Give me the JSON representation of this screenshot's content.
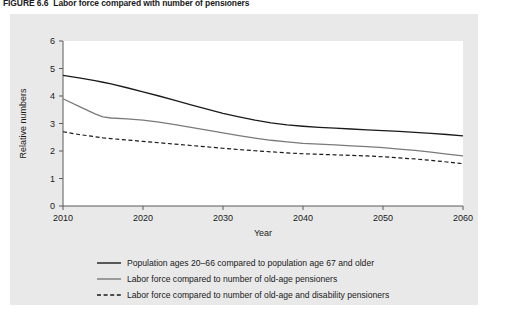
{
  "figure": {
    "number": "FIGURE 6.6",
    "caption": "Labor force compared with number of pensioners"
  },
  "panel": {
    "background_color": "#e9e9e9",
    "plot_background_color": "#ffffff"
  },
  "chart_data": {
    "type": "line",
    "title": "",
    "xlabel": "Year",
    "ylabel": "Relative numbers",
    "xlim": [
      2010,
      2060
    ],
    "ylim": [
      0,
      6
    ],
    "xticks": [
      2010,
      2020,
      2030,
      2040,
      2050,
      2060
    ],
    "xtick_labels": [
      "2010",
      "2020",
      "2030",
      "2040",
      "2050",
      "2060"
    ],
    "yticks": [
      0,
      1,
      2,
      3,
      4,
      5,
      6
    ],
    "ytick_labels": [
      "0",
      "1",
      "2",
      "3",
      "4",
      "5",
      "6"
    ],
    "grid": false,
    "legend_position": "below-left",
    "x": [
      2010,
      2012,
      2014,
      2015,
      2016,
      2018,
      2020,
      2022,
      2024,
      2026,
      2028,
      2030,
      2032,
      2034,
      2036,
      2038,
      2040,
      2042,
      2044,
      2046,
      2048,
      2050,
      2052,
      2054,
      2056,
      2058,
      2060
    ],
    "series": [
      {
        "name": "Population ages 20–66 compared to population age 67 and older",
        "color": "#1a1a1a",
        "style": "solid",
        "width": 1.3,
        "values": [
          4.75,
          4.66,
          4.56,
          4.5,
          4.44,
          4.3,
          4.15,
          4.0,
          3.84,
          3.68,
          3.52,
          3.37,
          3.24,
          3.12,
          3.02,
          2.95,
          2.9,
          2.86,
          2.83,
          2.8,
          2.77,
          2.74,
          2.71,
          2.68,
          2.64,
          2.6,
          2.55
        ]
      },
      {
        "name": "Labor force compared to number of old-age pensioners",
        "color": "#7a7a7a",
        "style": "solid",
        "width": 1.3,
        "values": [
          3.9,
          3.62,
          3.35,
          3.24,
          3.2,
          3.17,
          3.12,
          3.05,
          2.96,
          2.86,
          2.76,
          2.66,
          2.56,
          2.47,
          2.39,
          2.33,
          2.28,
          2.25,
          2.22,
          2.19,
          2.16,
          2.12,
          2.07,
          2.02,
          1.96,
          1.89,
          1.82
        ]
      },
      {
        "name": "Labor force compared to number of old-age and disability pensioners",
        "color": "#1a1a1a",
        "style": "dashed",
        "width": 1.2,
        "values": [
          2.7,
          2.6,
          2.52,
          2.48,
          2.45,
          2.4,
          2.35,
          2.3,
          2.25,
          2.2,
          2.15,
          2.1,
          2.05,
          2.01,
          1.97,
          1.93,
          1.9,
          1.88,
          1.86,
          1.84,
          1.82,
          1.79,
          1.75,
          1.71,
          1.66,
          1.6,
          1.54
        ]
      }
    ]
  },
  "legend": {
    "items": [
      {
        "label": "Population ages 20–66 compared to population age 67 and older",
        "color": "#1a1a1a",
        "style": "solid"
      },
      {
        "label": "Labor force compared to number of old-age pensioners",
        "color": "#7a7a7a",
        "style": "solid"
      },
      {
        "label": "Labor force compared to number of old-age and disability pensioners",
        "color": "#1a1a1a",
        "style": "dashed"
      }
    ]
  }
}
